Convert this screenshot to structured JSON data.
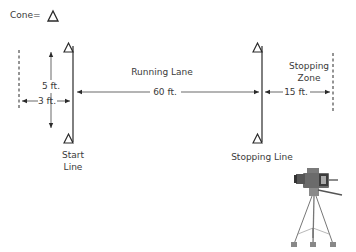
{
  "legend": {
    "label": "Cone=",
    "icon": "triangle-cone-icon"
  },
  "labels": {
    "running_lane": "Running Lane",
    "stopping_zone_line1": "Stopping",
    "stopping_zone_line2": "Zone",
    "start_line_line1": "Start",
    "start_line_line2": "Line",
    "stopping_line": "Stopping Line"
  },
  "dimensions": {
    "lane_width": "5 ft.",
    "start_offset": "3 ft.",
    "running_distance": "60 ft.",
    "stopping_distance": "15 ft."
  },
  "icons": {
    "cone": "triangle-cone-icon",
    "camera": "video-camera-tripod-icon"
  },
  "colors": {
    "line": "#2a2a2a",
    "text": "#3a3a3a",
    "camera_body": "#6b6b6b"
  }
}
